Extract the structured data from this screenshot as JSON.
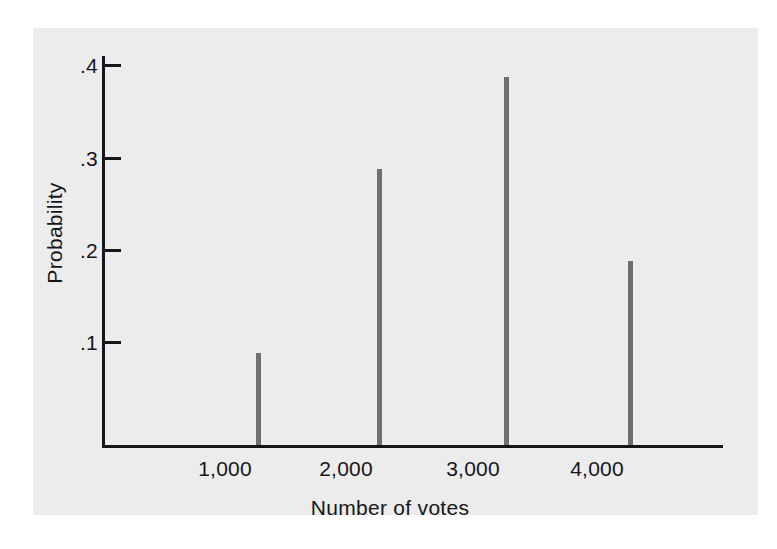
{
  "chart_data": {
    "type": "bar",
    "title": "",
    "subtitle": "",
    "xlabel": "Number of votes",
    "ylabel": "Probability",
    "categories": [
      "1,000",
      "2,000",
      "3,000",
      "4,000"
    ],
    "x": [
      1000,
      2000,
      3000,
      4000
    ],
    "values": [
      0.1,
      0.3,
      0.4,
      0.2
    ],
    "series": [
      {
        "name": "Probability",
        "values": [
          0.1,
          0.3,
          0.4,
          0.2
        ]
      }
    ],
    "y_tick_labels": [
      ".4",
      ".3",
      ".2",
      ".1"
    ],
    "y_tick_values": [
      0.4,
      0.3,
      0.2,
      0.1
    ],
    "x_tick_labels": [
      "1,000",
      "2,000",
      "3,000",
      "4,000"
    ],
    "xlim": [
      0,
      4800
    ],
    "ylim": [
      0,
      0.425
    ],
    "grid": false,
    "legend": false,
    "legend_position": "none",
    "annotations": [],
    "bar_color": "#6f6f6f",
    "axis_color": "#15151a",
    "panel_background": "#ececec",
    "page_background": "#ffffff"
  },
  "axes": {
    "y_title": "Probability",
    "x_title": "Number of votes",
    "y_ticks": [
      {
        "label": ".4",
        "value": 0.4
      },
      {
        "label": ".3",
        "value": 0.3
      },
      {
        "label": ".2",
        "value": 0.2
      },
      {
        "label": ".1",
        "value": 0.1
      }
    ],
    "x_ticks": [
      {
        "label": "1,000",
        "value": 1000
      },
      {
        "label": "2,000",
        "value": 2000
      },
      {
        "label": "3,000",
        "value": 3000
      },
      {
        "label": "4,000",
        "value": 4000
      }
    ]
  },
  "bars": [
    {
      "category": "1,000",
      "value": 0.1
    },
    {
      "category": "2,000",
      "value": 0.3
    },
    {
      "category": "3,000",
      "value": 0.4
    },
    {
      "category": "4,000",
      "value": 0.2
    }
  ]
}
